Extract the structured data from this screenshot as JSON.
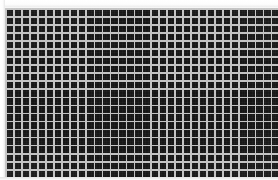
{
  "image": {
    "kind": "grid-mesh-pattern",
    "width": 278,
    "height": 180,
    "description": "High-contrast repeating square grid / mesh pattern",
    "alt_text": "Dense black and white square grid pattern filling the frame"
  },
  "pattern": {
    "columns": 34,
    "rows": 21,
    "cell_pitch_px": 8,
    "line_thickness_px": 2,
    "orientation": "orthogonal",
    "region": {
      "left_px": 5,
      "top_px": 8,
      "width_px": 273,
      "height_px": 170
    }
  },
  "colors": {
    "cell_fill": "#161616",
    "grid_line": "#c2c2c2",
    "background": "#ffffff",
    "margin_edge": "#e8e8e8"
  },
  "margins": {
    "top_px": 7,
    "left_px": 5,
    "right_px": 0,
    "bottom_px": 3
  }
}
